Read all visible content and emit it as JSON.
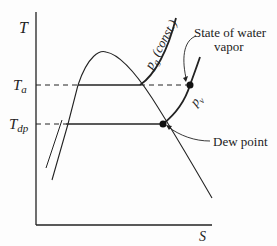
{
  "diagram": {
    "type": "T-s diagram",
    "axes": {
      "y_label": "T",
      "x_label": "S"
    },
    "levels": {
      "ta_label": "T",
      "ta_sub": "a",
      "tdp_label": "T",
      "tdp_sub": "dp"
    },
    "curves": {
      "pg_label": "p",
      "pg_sub": "g",
      "pg_suffix": " (const.)",
      "pv_label": "p",
      "pv_sub": "v"
    },
    "annotations": {
      "state_line1": "State of water",
      "state_line2": "vapor",
      "dew_point": "Dew point"
    },
    "colors": {
      "line": "#222222",
      "background": "#fdfdfd"
    }
  }
}
